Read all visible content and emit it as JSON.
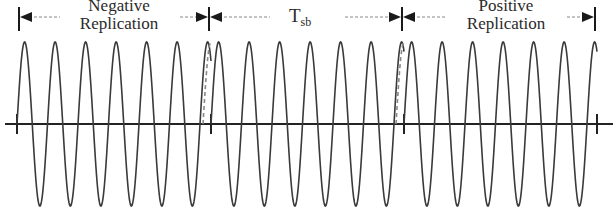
{
  "diagram": {
    "title": "",
    "segments": [
      {
        "id": "negative",
        "label_line1": "Negative",
        "label_line2": "Replication",
        "x_start": 19,
        "x_end": 209
      },
      {
        "id": "tsb",
        "label_main": "T",
        "label_sub": "sb",
        "x_start": 209,
        "x_end": 402
      },
      {
        "id": "positive",
        "label_line1": "Positive",
        "label_line2": "Replication",
        "x_start": 402,
        "x_end": 595
      }
    ],
    "boundaries_x": [
      19,
      209,
      402,
      595
    ],
    "axis": {
      "y": 124,
      "x_start": 5,
      "x_end": 613,
      "ticks_x": [
        17,
        211,
        404,
        597
      ]
    },
    "waveform": {
      "type": "sine",
      "period_px": 30.5,
      "amplitude_px": 82,
      "center_y": 124,
      "sections": [
        {
          "x_start": 17,
          "x_end": 211
        },
        {
          "x_start": 211,
          "x_end": 404
        },
        {
          "x_start": 404,
          "x_end": 597
        }
      ],
      "dashed_replicas": [
        {
          "x_start": 203,
          "x_end": 211
        },
        {
          "x_start": 396,
          "x_end": 404
        }
      ]
    },
    "colors": {
      "line": "#3a3a3a",
      "axis": "#222222",
      "arrow": "#1a1a1a",
      "dash": "#888888",
      "text": "#2a2a2a"
    }
  }
}
